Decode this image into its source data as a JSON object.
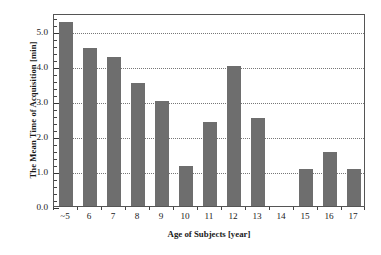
{
  "chart_data": {
    "type": "bar",
    "title": "",
    "xlabel": "Age of Subjects [year]",
    "ylabel": "The Mean Time of Acquisition [min]",
    "categories": [
      "~5",
      "6",
      "7",
      "8",
      "9",
      "10",
      "11",
      "12",
      "13",
      "14",
      "15",
      "16",
      "17"
    ],
    "values": [
      5.25,
      4.5,
      4.25,
      3.5,
      3.0,
      1.15,
      2.4,
      4.0,
      2.5,
      0.0,
      1.05,
      1.55,
      1.05
    ],
    "series": [
      {
        "name": "Mean time of acquisition",
        "values": [
          5.25,
          4.5,
          4.25,
          3.5,
          3.0,
          1.15,
          2.4,
          4.0,
          2.5,
          0.0,
          1.05,
          1.55,
          1.05
        ]
      }
    ],
    "ylim": [
      0.0,
      5.5
    ],
    "xlim": [
      0,
      13
    ],
    "ytick_labels": [
      "0.0",
      "1.0",
      "2.0",
      "3.0",
      "4.0",
      "5.0"
    ],
    "ytick_values": [
      0.0,
      1.0,
      2.0,
      3.0,
      4.0,
      5.0
    ],
    "yminor_tick_step": 0.2,
    "grid": true,
    "grid_axis": "y",
    "grid_style": "dotted",
    "legend": false,
    "legend_position": "none",
    "bar_color": "#6e6e6e",
    "frame_color": "#555555",
    "grid_color": "#777777",
    "background_color": "#ffffff",
    "bar_width_ratio": 0.6
  }
}
